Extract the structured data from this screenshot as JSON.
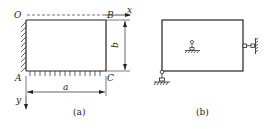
{
  "figure_a": {
    "caption": "(a)",
    "labels": {
      "O": "O",
      "B": "B",
      "A": "A",
      "C": "C",
      "x": "x",
      "y": "y",
      "width_dim": "a",
      "height_dim": "b"
    },
    "description": "Rectangular plate OBCA, fixed along edge OA (left) and simply supported along AC (bottom); dashed line OB along x-axis; y-axis downward"
  },
  "figure_b": {
    "caption": "(b)",
    "description": "Rectangular plate with pinned support at bottom-left corner, roller support at right edge midpoint, and interior support symbol at center"
  },
  "colors": {
    "line": "#222222",
    "background": "#ffffff"
  }
}
